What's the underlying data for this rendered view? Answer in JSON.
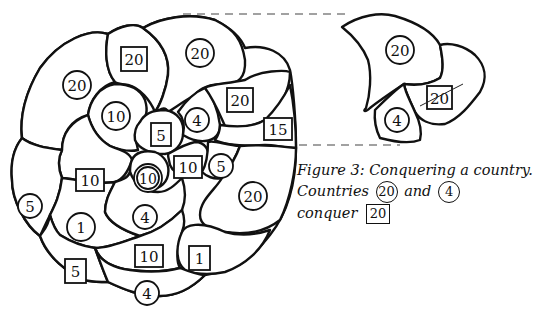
{
  "figure": {
    "caption": {
      "title": "Figure 3: Conquering a country.",
      "line2_prefix": "Countries",
      "attacker_1": "20",
      "connector": "and",
      "attacker_2": "4",
      "line3_prefix": "conquer",
      "target": "20"
    },
    "legend_notes": {
      "circle": "owned country (circled value)",
      "box": "other country (boxed value)"
    },
    "main_map": {
      "countries": [
        {
          "id": "c1",
          "shape": "circle",
          "value": "20"
        },
        {
          "id": "c2",
          "shape": "box",
          "value": "20"
        },
        {
          "id": "c3",
          "shape": "circle",
          "value": "20"
        },
        {
          "id": "c4",
          "shape": "circle",
          "value": "10"
        },
        {
          "id": "c5",
          "shape": "box",
          "value": "5"
        },
        {
          "id": "c6",
          "shape": "circle",
          "value": "4"
        },
        {
          "id": "c7",
          "shape": "box",
          "value": "20"
        },
        {
          "id": "c8",
          "shape": "box",
          "value": "15"
        },
        {
          "id": "c9",
          "shape": "box",
          "value": "10"
        },
        {
          "id": "c10",
          "shape": "circle",
          "value": "10"
        },
        {
          "id": "c11",
          "shape": "box",
          "value": "10"
        },
        {
          "id": "c12",
          "shape": "circle",
          "value": "5"
        },
        {
          "id": "c13",
          "shape": "circle",
          "value": "20"
        },
        {
          "id": "c14",
          "shape": "circle",
          "value": "5"
        },
        {
          "id": "c15",
          "shape": "circle",
          "value": "1"
        },
        {
          "id": "c16",
          "shape": "circle",
          "value": "4"
        },
        {
          "id": "c17",
          "shape": "box",
          "value": "10"
        },
        {
          "id": "c18",
          "shape": "box",
          "value": "1"
        },
        {
          "id": "c19",
          "shape": "box",
          "value": "5"
        },
        {
          "id": "c20",
          "shape": "circle",
          "value": "4"
        }
      ]
    },
    "detail_map": {
      "countries": [
        {
          "id": "d1",
          "shape": "circle",
          "value": "20"
        },
        {
          "id": "d2",
          "shape": "circle",
          "value": "4"
        },
        {
          "id": "d3",
          "shape": "box",
          "value": "20",
          "struck": true
        }
      ]
    }
  }
}
